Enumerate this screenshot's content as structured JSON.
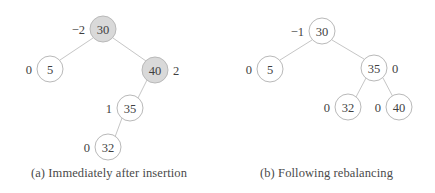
{
  "figure": {
    "background_color": "#ffffff",
    "node_fill_white": "#ffffff",
    "node_fill_shaded": "#d9d9d9",
    "node_stroke_color": "#b9b9b9",
    "edge_color": "#c6c6c6",
    "text_color": "#3f3f3f"
  },
  "panels": [
    {
      "id": "a",
      "caption": "(a) Immediately after insertion",
      "nodes": [
        {
          "key": "30",
          "balance": "−2",
          "balance_side": "left",
          "shaded": true,
          "cx": 103,
          "cy": 29,
          "r": 13,
          "bx": 85,
          "by": 29
        },
        {
          "key": "5",
          "balance": "0",
          "balance_side": "left",
          "shaded": false,
          "cx": 50,
          "cy": 69,
          "r": 13,
          "bx": 32,
          "by": 69
        },
        {
          "key": "40",
          "balance": "2",
          "balance_side": "right",
          "shaded": true,
          "cx": 155,
          "cy": 70,
          "r": 13,
          "bx": 173,
          "by": 70
        },
        {
          "key": "35",
          "balance": "1",
          "balance_side": "left",
          "shaded": false,
          "cx": 130,
          "cy": 108,
          "r": 13,
          "bx": 112,
          "by": 108
        },
        {
          "key": "32",
          "balance": "0",
          "balance_side": "left",
          "shaded": false,
          "cx": 108,
          "cy": 147,
          "r": 13,
          "bx": 90,
          "by": 147
        }
      ],
      "edges": [
        {
          "from": "30",
          "to": "5",
          "x1": 93,
          "y1": 38,
          "x2": 60,
          "y2": 60
        },
        {
          "from": "30",
          "to": "40",
          "x1": 113,
          "y1": 38,
          "x2": 146,
          "y2": 61
        },
        {
          "from": "40",
          "to": "35",
          "x1": 147,
          "y1": 80,
          "x2": 138,
          "y2": 98
        },
        {
          "from": "35",
          "to": "32",
          "x1": 122,
          "y1": 118,
          "x2": 115,
          "y2": 137
        }
      ]
    },
    {
      "id": "b",
      "caption": "(b) Following rebalancing",
      "nodes": [
        {
          "key": "30",
          "balance": "−1",
          "balance_side": "left",
          "shaded": false,
          "cx": 104,
          "cy": 31,
          "r": 13,
          "bx": 86,
          "by": 31
        },
        {
          "key": "5",
          "balance": "0",
          "balance_side": "left",
          "shaded": false,
          "cx": 52,
          "cy": 69,
          "r": 13,
          "bx": 34,
          "by": 69
        },
        {
          "key": "35",
          "balance": "0",
          "balance_side": "right",
          "shaded": false,
          "cx": 156,
          "cy": 68,
          "r": 13,
          "bx": 174,
          "by": 68
        },
        {
          "key": "32",
          "balance": "0",
          "balance_side": "left",
          "shaded": false,
          "cx": 130,
          "cy": 107,
          "r": 13,
          "bx": 112,
          "by": 107
        },
        {
          "key": "40",
          "balance": "0",
          "balance_side": "left",
          "shaded": false,
          "cx": 181,
          "cy": 107,
          "r": 13,
          "bx": 163,
          "by": 107
        }
      ],
      "edges": [
        {
          "from": "30",
          "to": "5",
          "x1": 94,
          "y1": 40,
          "x2": 62,
          "y2": 60
        },
        {
          "from": "30",
          "to": "35",
          "x1": 114,
          "y1": 40,
          "x2": 146,
          "y2": 59
        },
        {
          "from": "35",
          "to": "32",
          "x1": 148,
          "y1": 78,
          "x2": 138,
          "y2": 97
        },
        {
          "from": "35",
          "to": "40",
          "x1": 165,
          "y1": 78,
          "x2": 175,
          "y2": 97
        }
      ]
    }
  ]
}
